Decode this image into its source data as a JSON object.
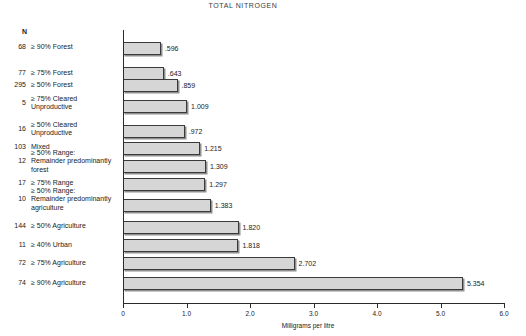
{
  "chart": {
    "title": "TOTAL NITROGEN",
    "n_header": "N",
    "xlabel": "Milligrams per litre",
    "tick_labels": [
      "0",
      "1.0",
      "2.0",
      "3.0",
      "4.0",
      "5.0",
      "6.0"
    ],
    "ge_symbol": "≥"
  },
  "chart_data": {
    "type": "bar",
    "orientation": "horizontal",
    "title": "TOTAL NITROGEN",
    "xlabel": "Milligrams per litre",
    "ylabel": "",
    "xlim": [
      0,
      6.0
    ],
    "xticks": [
      0,
      1.0,
      2.0,
      3.0,
      4.0,
      5.0,
      6.0
    ],
    "grid": false,
    "legend": false,
    "categories": [
      "≥ 90% Forest",
      "≥ 75% Forest",
      "≥ 50% Forest",
      "≥ 75% Cleared Unproductive",
      "≥ 50% Cleared Unproductive",
      "Mixed",
      "≥ 50% Range: Remainder predominantly forest",
      "≥ 75% Range",
      "≥ 50% Range: Remainder predominantly agriculture",
      "≥ 50% Agriculture",
      "≥ 40% Urban",
      "≥ 75% Agriculture",
      "≥ 90% Agriculture"
    ],
    "values": [
      0.596,
      0.643,
      0.859,
      1.009,
      0.972,
      1.215,
      1.309,
      1.297,
      1.383,
      1.82,
      1.818,
      2.702,
      5.354
    ],
    "value_labels": [
      ".596",
      ".643",
      ".859",
      "1.009",
      ".972",
      "1.215",
      "1.309",
      "1.297",
      "1.383",
      "1.820",
      "1.818",
      "2.702",
      "5.354"
    ],
    "sample_sizes": [
      "68",
      "77",
      "295",
      "5",
      "16",
      "103",
      "12",
      "17",
      "10",
      "144",
      "11",
      "72",
      "74"
    ]
  },
  "rows": [
    {
      "n": "68",
      "label_line1": "90% Forest",
      "label_line2": "",
      "label_line3": "",
      "value": ".596",
      "has_ge": true
    },
    {
      "n": "77",
      "label_line1": "75% Forest",
      "label_line2": "",
      "label_line3": "",
      "value": ".643",
      "has_ge": true
    },
    {
      "n": "295",
      "label_line1": "50% Forest",
      "label_line2": "",
      "label_line3": "",
      "value": ".859",
      "has_ge": true
    },
    {
      "n": "5",
      "label_line1": "75% Cleared",
      "label_line2": "Unproductive",
      "label_line3": "",
      "value": "1.009",
      "has_ge": true
    },
    {
      "n": "16",
      "label_line1": "50% Cleared",
      "label_line2": "Unproductive",
      "label_line3": "",
      "value": ".972",
      "has_ge": true
    },
    {
      "n": "103",
      "label_line1": "Mixed",
      "label_line2": "",
      "label_line3": "",
      "value": "1.215",
      "has_ge": false
    },
    {
      "n": "12",
      "label_line1": "50% Range:",
      "label_line2": "Remainder predominantly",
      "label_line3": "forest",
      "value": "1.309",
      "has_ge": true
    },
    {
      "n": "17",
      "label_line1": "75% Range",
      "label_line2": "",
      "label_line3": "",
      "value": "1.297",
      "has_ge": true
    },
    {
      "n": "10",
      "label_line1": "50% Range:",
      "label_line2": "Remainder predominantly",
      "label_line3": "agriculture",
      "value": "1.383",
      "has_ge": true
    },
    {
      "n": "144",
      "label_line1": "50% Agriculture",
      "label_line2": "",
      "label_line3": "",
      "value": "1.820",
      "has_ge": true
    },
    {
      "n": "11",
      "label_line1": "40% Urban",
      "label_line2": "",
      "label_line3": "",
      "value": "1.818",
      "has_ge": true
    },
    {
      "n": "72",
      "label_line1": "75% Agriculture",
      "label_line2": "",
      "label_line3": "",
      "value": "2.702",
      "has_ge": true
    },
    {
      "n": "74",
      "label_line1": "90% Agriculture",
      "label_line2": "",
      "label_line3": "",
      "value": "5.354",
      "has_ge": true
    }
  ]
}
